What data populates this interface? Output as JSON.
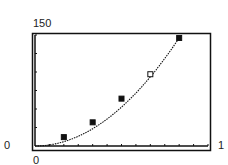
{
  "chart_data": {
    "type": "scatter",
    "title": "",
    "xlabel": "",
    "ylabel": "",
    "xlim": [
      0,
      12
    ],
    "ylim": [
      0,
      150
    ],
    "x_tick_step": 1,
    "y_tick_step": 25,
    "grid": false,
    "legend": null,
    "tick_labels": {
      "y_max": "150",
      "y_min": "0",
      "x_min": "0",
      "x_max": "1"
    },
    "series": [
      {
        "name": "data",
        "points": [
          {
            "x": 2,
            "y": 12,
            "marker": "filled-square"
          },
          {
            "x": 4,
            "y": 32,
            "marker": "filled-square"
          },
          {
            "x": 6,
            "y": 64,
            "marker": "filled-square"
          },
          {
            "x": 8,
            "y": 97,
            "marker": "open-square"
          },
          {
            "x": 10,
            "y": 146,
            "marker": "filled-square"
          }
        ]
      },
      {
        "name": "fit-curve",
        "style": "dotted-line",
        "function": "y = 1.46 x^2",
        "x_range": [
          0,
          10
        ]
      }
    ]
  },
  "colors": {
    "ink": "#111111",
    "background": "#ffffff"
  }
}
